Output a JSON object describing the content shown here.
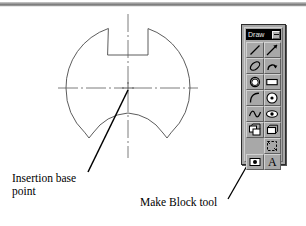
{
  "figure": {
    "type": "autocad-technical-drawing",
    "line_color": "#4a4a4a",
    "leader_color": "#000000",
    "center_mark": "crosshair"
  },
  "annotations": [
    {
      "id": "insertion-base-point",
      "text": "Insertion base\npoint",
      "leader_from": [
        88,
        172
      ],
      "leader_to": [
        128,
        91
      ]
    },
    {
      "id": "make-block-tool",
      "text": "Make Block tool",
      "leader_from": [
        228,
        199
      ],
      "leader_to": [
        272,
        122
      ]
    }
  ],
  "toolbar": {
    "title": "Draw",
    "close_label": "",
    "accent_titlebar": "#000000",
    "face_color": "#a8a8a8",
    "buttons": [
      {
        "name": "line-tool",
        "label": "Line"
      },
      {
        "name": "construction-line-tool",
        "label": "Construction Line"
      },
      {
        "name": "polyline-tool",
        "label": "Polyline"
      },
      {
        "name": "polygon-tool",
        "label": "Polygon"
      },
      {
        "name": "rectangle-tool",
        "label": "Rectangle"
      },
      {
        "name": "arc-tool",
        "label": "Arc"
      },
      {
        "name": "circle-tool",
        "label": "Circle"
      },
      {
        "name": "spline-tool",
        "label": "Spline"
      },
      {
        "name": "ellipse-tool",
        "label": "Ellipse"
      },
      {
        "name": "insert-block-tool",
        "label": "Insert Block"
      },
      {
        "name": "make-block-tool",
        "label": "Make Block"
      },
      {
        "name": "point-tool",
        "label": "Point"
      },
      {
        "name": "hatch-tool",
        "label": "Hatch"
      },
      {
        "name": "region-tool",
        "label": "Region"
      },
      {
        "name": "multiline-text-tool",
        "label": "Multiline Text"
      }
    ]
  }
}
